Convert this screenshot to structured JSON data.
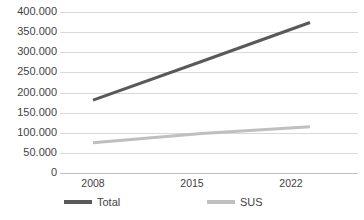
{
  "chart_data": {
    "type": "line",
    "title": "",
    "subtitle": "",
    "xlabel": "",
    "ylabel": "",
    "categories": [
      "2008",
      "2015",
      "2022"
    ],
    "x": [
      2008,
      2015,
      2022
    ],
    "series": [
      {
        "name": "Total",
        "color": "#595959",
        "values": [
          181000,
          277000,
          374000
        ],
        "value_labels": [
          "181.000",
          "277.000",
          "374.000"
        ]
      },
      {
        "name": "SUS",
        "color": "#bfbfbf",
        "values": [
          75000,
          98000,
          115000
        ],
        "value_labels": [
          "75.000",
          "98.000",
          "115.000"
        ]
      }
    ],
    "ylim": [
      0,
      400000
    ],
    "ytick_values": [
      0,
      50000,
      100000,
      150000,
      200000,
      250000,
      300000,
      350000,
      400000
    ],
    "ytick_labels": [
      "0",
      "50.000",
      "100.000",
      "150.000",
      "200.000",
      "250.000",
      "300.000",
      "350.000",
      "400.000"
    ],
    "xtick_labels": [
      "2008",
      "2015",
      "2022"
    ],
    "grid": {
      "horizontal": true,
      "vertical": false,
      "color": "#d9d9d9"
    },
    "legend": {
      "position": "bottom",
      "entries": [
        {
          "label": "Total",
          "color": "#595959"
        },
        {
          "label": "SUS",
          "color": "#bfbfbf"
        }
      ]
    },
    "background_color": "#ffffff",
    "text_color": "#3f3f3f"
  }
}
